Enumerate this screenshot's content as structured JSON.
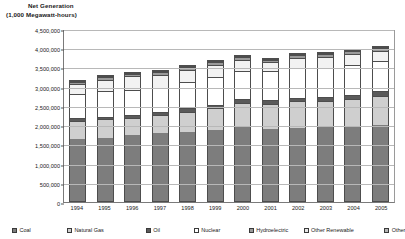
{
  "chart_data": {
    "type": "bar",
    "stacked": true,
    "title": "Net Generation",
    "subtitle": "(1,000 Megawatt-hours)",
    "xlabel": "",
    "ylabel": "",
    "grid": true,
    "legend_position": "bottom",
    "ylim": [
      0,
      4500000
    ],
    "ytick_step": 500000,
    "yticks": [
      "0",
      "500,000",
      "1,000,000",
      "1,500,000",
      "2,000,000",
      "2,500,000",
      "3,000,000",
      "3,500,000",
      "4,000,000",
      "4,500,000"
    ],
    "categories": [
      "1994",
      "1995",
      "1996",
      "1997",
      "1998",
      "1999",
      "2000",
      "2001",
      "2002",
      "2003",
      "2004",
      "2005"
    ],
    "series": [
      {
        "name": "Coal",
        "color": "#7d7d7d",
        "values": [
          1635000,
          1653000,
          1737000,
          1787000,
          1807000,
          1881000,
          1966000,
          1904000,
          1933000,
          1974000,
          1978000,
          2013000
        ]
      },
      {
        "name": "Natural Gas",
        "color": "#cfcfcf",
        "values": [
          460000,
          496000,
          455000,
          479000,
          531000,
          556000,
          601000,
          639000,
          691000,
          650000,
          710000,
          761000
        ]
      },
      {
        "name": "Oil",
        "color": "#5a5a5a",
        "values": [
          91000,
          74000,
          67000,
          78000,
          110000,
          86000,
          105000,
          120000,
          94000,
          119000,
          114000,
          122000
        ]
      },
      {
        "name": "Nuclear",
        "color": "#ffffff",
        "values": [
          640000,
          673000,
          675000,
          628000,
          674000,
          728000,
          754000,
          769000,
          780000,
          764000,
          789000,
          782000
        ]
      },
      {
        "name": "Hydroelectric",
        "color": "#f2f2f2",
        "values": [
          247000,
          297000,
          347000,
          356000,
          323000,
          319000,
          275000,
          217000,
          264000,
          275000,
          268000,
          270000
        ]
      },
      {
        "name": "Other Renewable",
        "color": "#9a9a9a",
        "values": [
          72000,
          75000,
          76000,
          77000,
          77000,
          79000,
          80000,
          71000,
          79000,
          80000,
          83000,
          87000
        ]
      },
      {
        "name": "Other",
        "color": "#d8d8d8",
        "values": [
          15000,
          16000,
          17000,
          18000,
          19000,
          20000,
          21000,
          21000,
          22000,
          23000,
          24000,
          25000
        ]
      }
    ]
  },
  "legend": {
    "items": [
      {
        "label": "Coal",
        "swatch": "#7d7d7d"
      },
      {
        "label": "Natural Gas",
        "swatch": "#cfcfcf"
      },
      {
        "label": "Oil",
        "swatch": "#5a5a5a"
      },
      {
        "label": "Nuclear",
        "swatch": "#ffffff"
      },
      {
        "label": "Hydroelectric",
        "swatch": "#9a9a9a"
      },
      {
        "label": "Other Renewable",
        "swatch": "#e8e8e8"
      },
      {
        "label": "Other",
        "swatch": "#b5b5b5"
      }
    ]
  }
}
